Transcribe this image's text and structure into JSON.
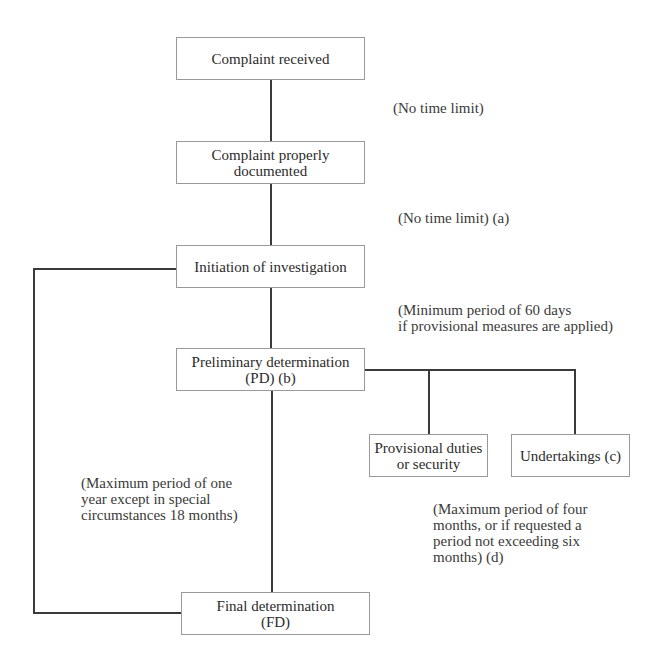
{
  "diagram": {
    "type": "flowchart",
    "nodes": {
      "complaint_received": "Complaint received",
      "complaint_documented_l1": "Complaint properly",
      "complaint_documented_l2": "documented",
      "initiation": "Initiation of investigation",
      "preliminary_l1": "Preliminary determination",
      "preliminary_l2": "(PD) (b)",
      "provisional_l1": "Provisional duties",
      "provisional_l2": "or security",
      "undertakings": "Undertakings (c)",
      "final_l1": "Final determination",
      "final_l2": "(FD)"
    },
    "notes": {
      "no_time_limit": "(No time limit)",
      "no_time_limit_a": "(No time limit) (a)",
      "minimum_period": "(Minimum period of 60 days\nif provisional measures are applied)",
      "maximum_one_year": "(Maximum period of one\nyear except in special\ncircumstances 18 months)",
      "maximum_four_months": "(Maximum period of four\nmonths, or if requested a\nperiod not exceeding six\nmonths) (d)"
    },
    "colors": {
      "line": "#3a3a3a",
      "box_border": "#9a9a9a",
      "text": "#2b2b2b"
    }
  }
}
